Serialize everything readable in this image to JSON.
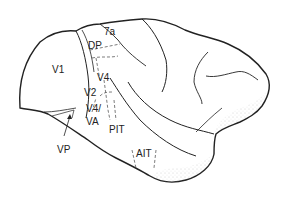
{
  "diagram": {
    "type": "lateral view of monkey brain with visual cortical areas",
    "labels": [
      {
        "id": "V1",
        "text": "V1",
        "x": 52,
        "y": 70
      },
      {
        "id": "7a",
        "text": "7a",
        "x": 104,
        "y": 32
      },
      {
        "id": "DP",
        "text": "DP",
        "x": 88,
        "y": 45
      },
      {
        "id": "V4",
        "text": "V4",
        "x": 97,
        "y": 72
      },
      {
        "id": "V2",
        "text": "V2",
        "x": 84,
        "y": 90
      },
      {
        "id": "V4l",
        "text": "V4/",
        "x": 86,
        "y": 106
      },
      {
        "id": "VA",
        "text": "VA",
        "x": 86,
        "y": 119
      },
      {
        "id": "PIT",
        "text": "PIT",
        "x": 108,
        "y": 126
      },
      {
        "id": "AIT",
        "text": "AIT",
        "x": 135,
        "y": 151
      },
      {
        "id": "VP",
        "text": "VP",
        "x": 58,
        "y": 144
      }
    ],
    "colors": {
      "ink": "#222222",
      "background": "#ffffff",
      "stipple": "#888888"
    }
  }
}
